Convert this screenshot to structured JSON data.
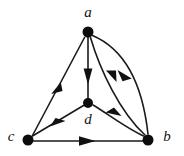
{
  "figure": {
    "type": "directed-graph",
    "width": 184,
    "height": 156,
    "background_color": "#ffffff",
    "ink_color": "#111111"
  },
  "graph": {
    "nodes": [
      {
        "id": "a",
        "label": "a",
        "x": 88,
        "y": 32,
        "radius": 5.5,
        "label_x": 88,
        "label_y": 14,
        "label_position": "above"
      },
      {
        "id": "d",
        "label": "d",
        "x": 88,
        "y": 103,
        "radius": 5.0,
        "label_x": 88,
        "label_y": 121,
        "label_position": "below"
      },
      {
        "id": "c",
        "label": "c",
        "x": 28,
        "y": 140,
        "radius": 5.5,
        "label_x": 11,
        "label_y": 138,
        "label_position": "left"
      },
      {
        "id": "b",
        "label": "b",
        "x": 148,
        "y": 140,
        "radius": 5.5,
        "label_x": 167,
        "label_y": 138,
        "label_position": "right"
      }
    ],
    "edges": [
      {
        "id": "c-to-a",
        "from": "c",
        "to": "a",
        "shape": "straight",
        "arrow": "mid",
        "arrow_direction": "up-right"
      },
      {
        "id": "a-to-d",
        "from": "a",
        "to": "d",
        "shape": "straight",
        "arrow": "mid",
        "arrow_direction": "down"
      },
      {
        "id": "a-to-b",
        "from": "a",
        "to": "b",
        "shape": "curved-outer",
        "arrow": "mid",
        "arrow_direction": "down-right"
      },
      {
        "id": "b-to-a",
        "from": "b",
        "to": "a",
        "shape": "curved-inner",
        "arrow": "mid",
        "arrow_direction": "up-left"
      },
      {
        "id": "b-to-d",
        "from": "b",
        "to": "d",
        "shape": "curved-slight",
        "arrow": "mid",
        "arrow_direction": "left"
      },
      {
        "id": "d-to-c",
        "from": "d",
        "to": "c",
        "shape": "straight",
        "arrow": "mid",
        "arrow_direction": "down-left"
      },
      {
        "id": "c-to-b",
        "from": "c",
        "to": "b",
        "shape": "straight",
        "arrow": "mid",
        "arrow_direction": "right"
      }
    ]
  }
}
